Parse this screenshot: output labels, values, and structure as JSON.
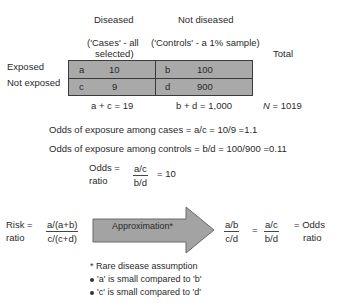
{
  "headers": {
    "diseased": "Diseased",
    "not_diseased": "Not diseased",
    "cases_line1": "('Cases' - all",
    "cases_line2": "selected)",
    "controls": "('Controls' - a 1% sample)",
    "total": "Total"
  },
  "rows": {
    "exposed": "Exposed",
    "not_exposed": "Not exposed"
  },
  "cells": [
    {
      "letter": "a",
      "value": "10"
    },
    {
      "letter": "b",
      "value": "100"
    },
    {
      "letter": "c",
      "value": "9"
    },
    {
      "letter": "d",
      "value": "900"
    }
  ],
  "totals": {
    "cases_total": "a + c = 19",
    "controls_total": "b + d = 1,000",
    "n_label": "N",
    "n_value": " = 1019"
  },
  "odds": {
    "cases_line": "Odds of exposure among cases = a/c = 10/9 =1.1",
    "controls_line": "Odds of exposure among controls = b/d = 100/900 =0.11",
    "or_label_1": "Odds =",
    "or_label_2": "ratio",
    "or_num": "a/c",
    "or_den": "b/d",
    "or_result": "= 10"
  },
  "risk": {
    "label_1": "Risk =",
    "label_2": "ratio",
    "num": "a/(a+b)",
    "den": "c/(c+d)",
    "arrow_label": "Approximation*",
    "frac1_num": "a/b",
    "frac1_den": "c/d",
    "equals": "=",
    "frac2_num": "a/c",
    "frac2_den": "b/d",
    "result_1": "= Odds",
    "result_2": "ratio"
  },
  "notes": {
    "title": "* Rare disease assumption",
    "bullets": [
      "'a' is small compared to 'b'",
      "'c' is small compared to 'd'"
    ]
  },
  "colors": {
    "table_fill": "#a9a9a9",
    "arrow_fill": "#a3a3a3",
    "text": "#2a2a2a"
  }
}
